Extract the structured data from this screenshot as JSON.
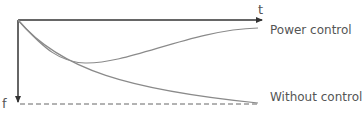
{
  "diagram": {
    "x_axis_label": "t",
    "y_axis_label": "f",
    "curves": [
      {
        "name": "Power control",
        "color": "#8a8a8a"
      },
      {
        "name": "Without control",
        "color": "#8a8a8a"
      }
    ],
    "axis_color": "#333333",
    "dashed_line_color": "#555555"
  }
}
